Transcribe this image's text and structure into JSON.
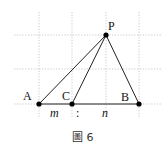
{
  "figure": {
    "caption": "圖 6",
    "points": {
      "P": {
        "label": "P",
        "x": 106,
        "y": 35
      },
      "A": {
        "label": "A",
        "x": 39,
        "y": 104
      },
      "C": {
        "label": "C",
        "x": 72,
        "y": 104
      },
      "B": {
        "label": "B",
        "x": 139,
        "y": 104
      }
    },
    "segment_labels": {
      "m": "m",
      "ratio": ":",
      "n": "n"
    },
    "grid": {
      "vertical_x": [
        39,
        72,
        106,
        139
      ],
      "horizontal_y": [
        35,
        69,
        104
      ],
      "color": "#bbbbbb"
    },
    "colors": {
      "line": "#222222",
      "point": "#000000"
    }
  }
}
